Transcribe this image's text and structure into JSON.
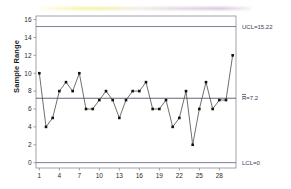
{
  "chart_data": {
    "type": "line",
    "title": "",
    "subtitle": "",
    "xlabel": "",
    "ylabel": "Sample Range",
    "x": [
      1,
      2,
      3,
      4,
      5,
      6,
      7,
      8,
      9,
      10,
      11,
      12,
      13,
      14,
      15,
      16,
      17,
      18,
      19,
      20,
      21,
      22,
      23,
      24,
      25,
      26,
      27,
      28,
      29,
      30
    ],
    "values": [
      10,
      4,
      5,
      8,
      9,
      8,
      10,
      6,
      6,
      7,
      8,
      7,
      5,
      7,
      8,
      8,
      9,
      6,
      6,
      7,
      4,
      5,
      8,
      2,
      6,
      9,
      6,
      7,
      7,
      12
    ],
    "series": [
      {
        "name": "Sample Range",
        "values": [
          10,
          4,
          5,
          8,
          9,
          8,
          10,
          6,
          6,
          7,
          8,
          7,
          5,
          7,
          8,
          8,
          9,
          6,
          6,
          7,
          4,
          5,
          8,
          2,
          6,
          9,
          6,
          7,
          7,
          12
        ]
      }
    ],
    "xlim": [
      0.5,
      30.5
    ],
    "ylim": [
      -0.6,
      16.4
    ],
    "ytick_labels": [
      "0",
      "2",
      "4",
      "6",
      "8",
      "10",
      "12",
      "14",
      "16"
    ],
    "ytick_values": [
      0,
      2,
      4,
      6,
      8,
      10,
      12,
      14,
      16
    ],
    "xtick_labels": [
      "1",
      "4",
      "7",
      "10",
      "13",
      "16",
      "19",
      "22",
      "25",
      "28"
    ],
    "xtick_values": [
      1,
      4,
      7,
      10,
      13,
      16,
      19,
      22,
      25,
      28
    ],
    "grid": false,
    "legend": "none",
    "marker": "filled-square",
    "control_limits": [
      {
        "name": "UCL",
        "label": "UCL=15.22",
        "value": 15.22,
        "color": "#6f6f8c"
      },
      {
        "name": "CL",
        "label": "=7.2",
        "label_prefix": "R",
        "display": "R̅=7.2",
        "value": 7.2,
        "color": "#555566"
      },
      {
        "name": "LCL",
        "label": "LCL=0",
        "value": 0,
        "color": "#6f6f8c"
      }
    ],
    "line_color": "#555555",
    "marker_color": "#111111",
    "axis_color": "#8a8a9a",
    "background": "#ffffff"
  },
  "labels": {
    "y_axis_title": "Sample Range",
    "ucl": "UCL=15.22",
    "cl_bar_letter": "R",
    "cl_value": "=7.2",
    "lcl": "LCL=0"
  }
}
